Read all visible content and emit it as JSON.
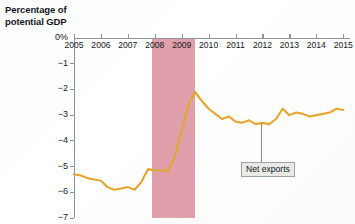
{
  "chart_data": {
    "type": "line",
    "title": "",
    "ylabel": "Percentage of potential GDP",
    "ylabel_line1": "Percentage of",
    "ylabel_line2": "potential GDP",
    "xlabel": "",
    "xlim": [
      2005,
      2015.25
    ],
    "ylim": [
      -7,
      0
    ],
    "grid": false,
    "legend_position": "inline-annotation",
    "y_ticks": [
      {
        "value": 0,
        "label": "0%"
      },
      {
        "value": -1,
        "label": "−1"
      },
      {
        "value": -2,
        "label": "−2"
      },
      {
        "value": -3,
        "label": "−3"
      },
      {
        "value": -4,
        "label": "−4"
      },
      {
        "value": -5,
        "label": "−5"
      },
      {
        "value": -6,
        "label": "−6"
      },
      {
        "value": -7,
        "label": "−7"
      }
    ],
    "x_ticks": [
      {
        "value": 2005,
        "label": "2005"
      },
      {
        "value": 2006,
        "label": "2006"
      },
      {
        "value": 2007,
        "label": "2007"
      },
      {
        "value": 2008,
        "label": "2008"
      },
      {
        "value": 2009,
        "label": "2009"
      },
      {
        "value": 2010,
        "label": "2010"
      },
      {
        "value": 2011,
        "label": "2011"
      },
      {
        "value": 2012,
        "label": "2012"
      },
      {
        "value": 2013,
        "label": "2013"
      },
      {
        "value": 2014,
        "label": "2014"
      },
      {
        "value": 2015,
        "label": "2015"
      }
    ],
    "shaded_regions": [
      {
        "name": "recession",
        "x_start": 2007.9,
        "x_end": 2009.5,
        "color": "#dfa0ac"
      }
    ],
    "annotations": [
      {
        "name": "net-exports-callout",
        "text": "Net exports",
        "anchor_x": 2011.95,
        "anchor_y": -3.3,
        "label_x": 2011.2,
        "label_y": -5.05
      }
    ],
    "series": [
      {
        "name": "Net exports",
        "color": "#e3a72f",
        "x": [
          2005.0,
          2005.25,
          2005.5,
          2005.75,
          2006.0,
          2006.25,
          2006.5,
          2006.75,
          2007.0,
          2007.25,
          2007.5,
          2007.75,
          2008.0,
          2008.25,
          2008.5,
          2008.75,
          2009.0,
          2009.25,
          2009.5,
          2009.75,
          2010.0,
          2010.25,
          2010.5,
          2010.75,
          2011.0,
          2011.25,
          2011.5,
          2011.75,
          2012.0,
          2012.25,
          2012.5,
          2012.75,
          2013.0,
          2013.25,
          2013.5,
          2013.75,
          2014.0,
          2014.25,
          2014.5,
          2014.75,
          2015.0
        ],
        "values": [
          -5.3,
          -5.35,
          -5.45,
          -5.5,
          -5.55,
          -5.8,
          -5.9,
          -5.85,
          -5.8,
          -5.9,
          -5.6,
          -5.1,
          -5.15,
          -5.15,
          -5.15,
          -4.6,
          -3.6,
          -2.6,
          -2.1,
          -2.45,
          -2.75,
          -2.95,
          -3.15,
          -3.05,
          -3.25,
          -3.3,
          -3.2,
          -3.35,
          -3.3,
          -3.35,
          -3.15,
          -2.75,
          -3.0,
          -2.9,
          -2.95,
          -3.05,
          -3.0,
          -2.95,
          -2.9,
          -2.75,
          -2.8
        ]
      }
    ]
  },
  "ghost_text": {
    "g1": "— — — — —",
    "g2": "— — — —",
    "g3": "— — — — —"
  }
}
